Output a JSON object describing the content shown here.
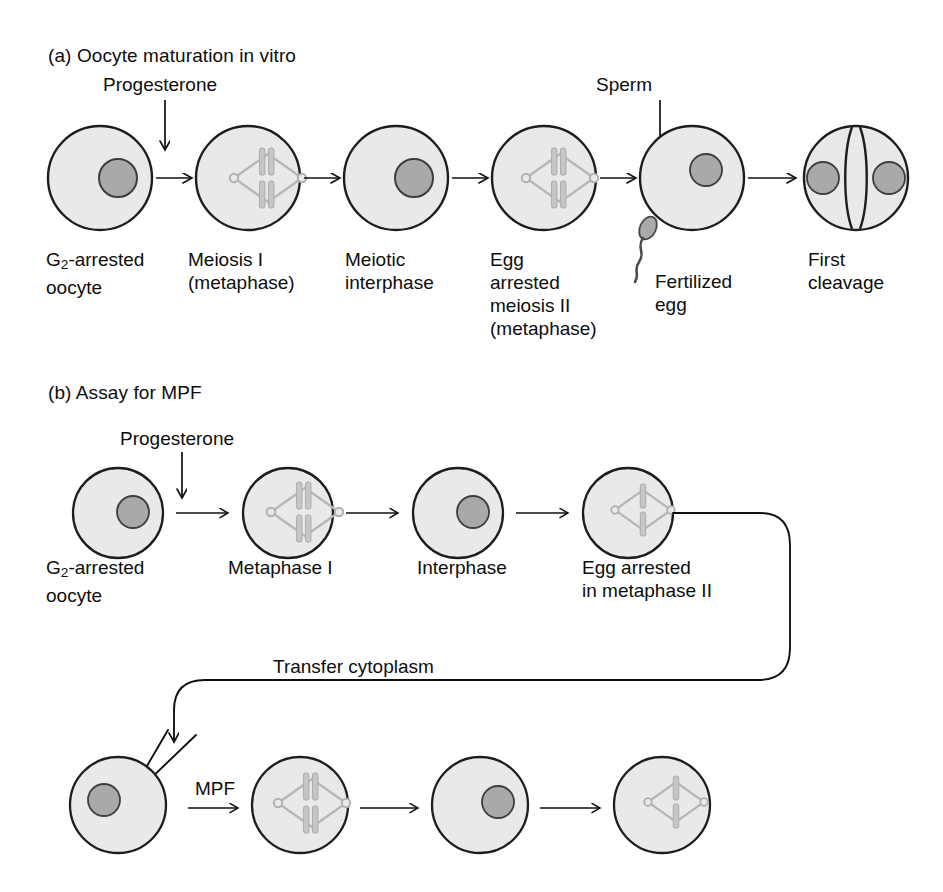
{
  "figure": {
    "kind": "biology-process-diagram",
    "colors": {
      "cell_fill": "#e9e9e9",
      "cell_stroke": "#1d1d1d",
      "nucleus_fill": "#a9a9a9",
      "nucleus_stroke": "#3a3a3a",
      "spindle_stroke": "#b4b4b4",
      "chromosome_fill": "#c4c4c4",
      "arrow_stroke": "#101010",
      "text": "#0d0d0d",
      "background": "#ffffff"
    }
  },
  "panel_a": {
    "title": "(a) Oocyte maturation in vitro",
    "stimuli": [
      {
        "name": "progesterone-stimulus",
        "label": "Progesterone"
      },
      {
        "name": "sperm-stimulus",
        "label": "Sperm"
      }
    ],
    "stages": [
      {
        "id": "g2-arrested-oocyte",
        "label": "G2-arrested\noocyte",
        "label_html": "G<sub>2</sub>-arrested<br>oocyte",
        "content": "nucleus"
      },
      {
        "id": "meiosis-i-metaphase",
        "label": "Meiosis I\n(metaphase)",
        "label_html": "Meiosis I<br>(metaphase)",
        "content": "spindle-double"
      },
      {
        "id": "meiotic-interphase",
        "label": "Meiotic\ninterphase",
        "label_html": "Meiotic<br>interphase",
        "content": "nucleus"
      },
      {
        "id": "egg-arrested-meiosis-ii",
        "label": "Egg\narrested\nmeiosis II\n(metaphase)",
        "label_html": "Egg<br>arrested<br>meiosis II<br>(metaphase)",
        "content": "spindle-double"
      },
      {
        "id": "fertilized-egg",
        "label": "Fertilized\negg",
        "label_html": "Fertilized<br>egg",
        "content": "nucleus-with-sperm"
      },
      {
        "id": "first-cleavage",
        "label": "First\ncleavage",
        "label_html": "First<br>cleavage",
        "content": "cleaved-two-nuclei"
      }
    ]
  },
  "panel_b": {
    "title": "(b) Assay for MPF",
    "stimuli": [
      {
        "name": "progesterone-stimulus",
        "label": "Progesterone"
      }
    ],
    "transfer_label": "Transfer cytoplasm",
    "injection_label": "MPF",
    "row_top": [
      {
        "id": "g2-arrested-oocyte-b",
        "label": "G2-arrested\noocyte",
        "label_html": "G<sub>2</sub>-arrested<br>oocyte",
        "content": "nucleus"
      },
      {
        "id": "metaphase-i",
        "label": "Metaphase I",
        "label_html": "Metaphase I",
        "content": "spindle-double"
      },
      {
        "id": "interphase",
        "label": "Interphase",
        "label_html": "Interphase",
        "content": "nucleus"
      },
      {
        "id": "egg-arrested-in-metaphase-ii",
        "label": "Egg arrested\nin metaphase II",
        "label_html": "Egg arrested<br>in metaphase II",
        "content": "spindle-single"
      }
    ],
    "row_bottom": [
      {
        "id": "recipient-oocyte",
        "label": "",
        "label_html": "",
        "content": "nucleus"
      },
      {
        "id": "induced-metaphase-i",
        "label": "",
        "label_html": "",
        "content": "spindle-double"
      },
      {
        "id": "induced-interphase",
        "label": "",
        "label_html": "",
        "content": "nucleus"
      },
      {
        "id": "induced-metaphase-ii",
        "label": "",
        "label_html": "",
        "content": "spindle-single"
      }
    ]
  }
}
